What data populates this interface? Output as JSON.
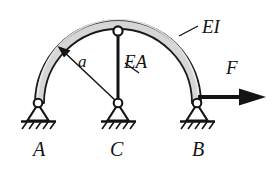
{
  "figure": {
    "type": "structural-mechanics-diagram",
    "canvas": {
      "width": 274,
      "height": 173
    },
    "colors": {
      "background": "#ffffff",
      "arch_fill": "#d6d6d6",
      "arch_outline": "#1a1a1a",
      "line": "#141414",
      "text": "#141414",
      "hatch": "#141414"
    },
    "labels": {
      "support_left": "A",
      "support_center": "C",
      "support_right": "B",
      "arch_stiffness": "EI",
      "column_stiffness": "EA",
      "radius": "a",
      "force": "F"
    },
    "geometry": {
      "arch_center_x": 118,
      "arch_center_y": 103,
      "arch_radius_outer": 83,
      "arch_radius_inner": 74,
      "span_left_x": 38,
      "span_right_x": 197,
      "base_y": 103,
      "crown_y": 20,
      "column_top_y": 31,
      "column_x": 118
    },
    "members": [
      {
        "name": "semicircular-arch",
        "stiffness": "EI",
        "from": "A",
        "to": "B"
      },
      {
        "name": "vertical-tie-column",
        "stiffness": "EA",
        "from": "crown",
        "to": "C"
      }
    ],
    "supports": [
      {
        "name": "A",
        "kind": "pinned",
        "x": 38,
        "y": 103
      },
      {
        "name": "C",
        "kind": "pinned",
        "x": 118,
        "y": 103
      },
      {
        "name": "B",
        "kind": "pinned",
        "x": 197,
        "y": 103
      }
    ],
    "loads": [
      {
        "name": "F",
        "kind": "point-force",
        "direction": "horizontal-right",
        "applied_at": "B",
        "x": 197,
        "y": 103
      }
    ],
    "dimensions": [
      {
        "name": "a",
        "kind": "radius",
        "from": "C",
        "to": "arch-inner-surface"
      }
    ]
  }
}
